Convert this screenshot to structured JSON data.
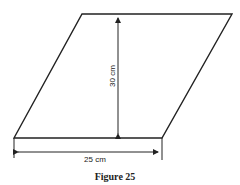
{
  "figure": {
    "caption": "Figure 25",
    "shape": "parallelogram",
    "base_label": "25 cm",
    "height_label": "30 cm",
    "line_color": "#222222"
  }
}
